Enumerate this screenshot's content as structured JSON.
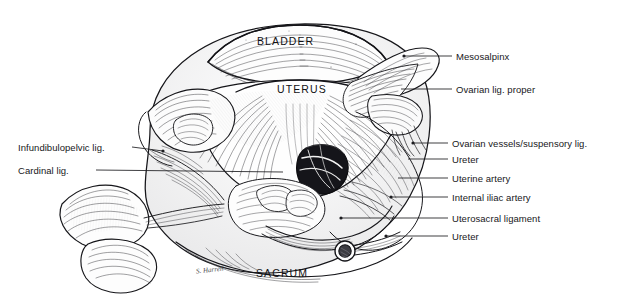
{
  "figure": {
    "ink_color": "#1a1a1d",
    "background_color": "#ffffff",
    "signature": "S. Harrell"
  },
  "organ_labels": [
    {
      "name": "bladder",
      "text": "BLADDER",
      "x": 257,
      "y": 36
    },
    {
      "name": "uterus",
      "text": "UTERUS",
      "x": 277,
      "y": 84
    },
    {
      "name": "sacrum",
      "text": "SACRUM",
      "x": 256,
      "y": 268
    }
  ],
  "callouts_right": [
    {
      "name": "mesosalpinx",
      "text": "Mesosalpinx",
      "x": 456,
      "y": 52,
      "line_x1": 404,
      "line_y1": 56,
      "line_x2": 452,
      "line_y2": 56,
      "dot_x": 404,
      "dot_y": 56
    },
    {
      "name": "ovarian-lig-proper",
      "text": "Ovarian lig. proper",
      "x": 456,
      "y": 85,
      "line_x1": 401,
      "line_y1": 89,
      "line_x2": 452,
      "line_y2": 89,
      "dot_x": null,
      "dot_y": null
    },
    {
      "name": "ovarian-vessels",
      "text": "Ovarian vessels/suspensory lig.",
      "x": 452,
      "y": 139,
      "line_x1": 413,
      "line_y1": 143,
      "line_x2": 448,
      "line_y2": 143,
      "dot_x": 413,
      "dot_y": 143
    },
    {
      "name": "ureter-upper",
      "text": "Ureter",
      "x": 452,
      "y": 155,
      "line_x1": 408,
      "line_y1": 159,
      "line_x2": 448,
      "line_y2": 159,
      "dot_x": null,
      "dot_y": null
    },
    {
      "name": "uterine-artery",
      "text": "Uterine artery",
      "x": 452,
      "y": 174,
      "line_x1": 398,
      "line_y1": 178,
      "line_x2": 448,
      "line_y2": 178,
      "dot_x": null,
      "dot_y": null
    },
    {
      "name": "internal-iliac",
      "text": "Internal iliac artery",
      "x": 452,
      "y": 193,
      "line_x1": 391,
      "line_y1": 197,
      "line_x2": 448,
      "line_y2": 197,
      "dot_x": 391,
      "dot_y": 197
    },
    {
      "name": "uterosacral-lig",
      "text": "Uterosacral ligament",
      "x": 452,
      "y": 214,
      "line_x1": 341,
      "line_y1": 218,
      "line_x2": 448,
      "line_y2": 218,
      "dot_x": 341,
      "dot_y": 218
    },
    {
      "name": "ureter-lower",
      "text": "Ureter",
      "x": 452,
      "y": 232,
      "line_x1": 386,
      "line_y1": 236,
      "line_x2": 448,
      "line_y2": 236,
      "dot_x": 386,
      "dot_y": 236
    }
  ],
  "callouts_left": [
    {
      "name": "infundibulopelvic-lig",
      "text": "Infundibulopelvic lig.",
      "x": 18,
      "y": 143,
      "line_x1": 132,
      "line_y1": 147,
      "line_x2": 163,
      "line_y2": 151,
      "dot_x": 163,
      "dot_y": 151
    },
    {
      "name": "cardinal-lig",
      "text": "Cardinal lig.",
      "x": 18,
      "y": 166,
      "line_x1": 96,
      "line_y1": 170,
      "line_x2": 283,
      "line_y2": 172,
      "dot_x": null,
      "dot_y": null
    }
  ]
}
